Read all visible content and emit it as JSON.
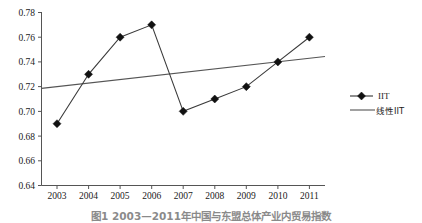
{
  "chart_data": {
    "type": "line",
    "title": "",
    "xlabel": "",
    "ylabel": "",
    "categories": [
      "2003",
      "2004",
      "2005",
      "2006",
      "2007",
      "2008",
      "2009",
      "2010",
      "2011"
    ],
    "ylim": [
      0.64,
      0.78
    ],
    "yticks": [
      "0.78",
      "0.76",
      "0.74",
      "0.72",
      "0.70",
      "0.68",
      "0.66",
      "0.64"
    ],
    "ytick_values": [
      0.78,
      0.76,
      0.74,
      0.72,
      0.7,
      0.68,
      0.66,
      0.64
    ],
    "grid": false,
    "legend_position": "right",
    "series": [
      {
        "name": "IIT",
        "type": "line-marker",
        "marker": "diamond",
        "color": "#333333",
        "values": [
          0.69,
          0.73,
          0.76,
          0.77,
          0.7,
          0.71,
          0.72,
          0.74,
          0.76
        ]
      },
      {
        "name": "线性IIT",
        "type": "trendline",
        "marker": "none",
        "color": "#555555",
        "values": [
          0.72,
          0.7229,
          0.7258,
          0.7287,
          0.7315,
          0.7344,
          0.7373,
          0.7402,
          0.743
        ]
      }
    ]
  },
  "legend": {
    "items": [
      {
        "label": "IIT",
        "marker": "diamond-line"
      },
      {
        "label": "线性IIT",
        "marker": "plain-line"
      }
    ]
  },
  "caption": {
    "text": "图1  2003—2011年中国与东盟总体产业内贸易指数"
  },
  "colors": {
    "series_line": "#333333",
    "trend_line": "#555555",
    "marker": "#111111",
    "axis": "#555555",
    "text": "#1a1a1a",
    "background": "#ffffff"
  }
}
